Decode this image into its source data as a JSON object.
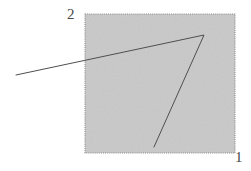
{
  "figure": {
    "title": "",
    "canvas": {
      "width": 251,
      "height": 171,
      "background": "#ffffff"
    },
    "region": {
      "name": "shaded-square",
      "x": 85,
      "y": 14,
      "width": 150,
      "height": 139,
      "fill_color": "#c9c9c9",
      "border_style": "dotted",
      "border_color": "#8c8c8c",
      "texture": "noise"
    },
    "labels": {
      "axis_2": "2",
      "axis_1": "1"
    },
    "label_positions": {
      "axis_2": {
        "x": 67,
        "y": 7
      },
      "axis_1": {
        "x": 235,
        "y": 150
      }
    },
    "polyline": {
      "name": "angle-path",
      "stroke_color": "#4f4f4f",
      "stroke_width": 1,
      "points": [
        {
          "x": 16,
          "y": 75
        },
        {
          "x": 204,
          "y": 35
        },
        {
          "x": 154,
          "y": 147
        }
      ],
      "vertex": {
        "x": 204,
        "y": 35
      }
    }
  },
  "chart_data": {
    "type": "line",
    "title": "",
    "xlabel": "1",
    "ylabel": "2",
    "grid": false,
    "legend": "none",
    "xlim": [
      85,
      235
    ],
    "ylim": [
      14,
      153
    ],
    "series": [
      {
        "name": "angle-path",
        "x": [
          16,
          204,
          154
        ],
        "y": [
          75,
          35,
          147
        ]
      }
    ],
    "annotations": [
      {
        "text": "2",
        "x": 67,
        "y": 7
      },
      {
        "text": "1",
        "x": 235,
        "y": 150
      }
    ],
    "shaded_region": {
      "x0": 85,
      "y0": 14,
      "x1": 235,
      "y1": 153,
      "fill": "#c9c9c9"
    }
  }
}
